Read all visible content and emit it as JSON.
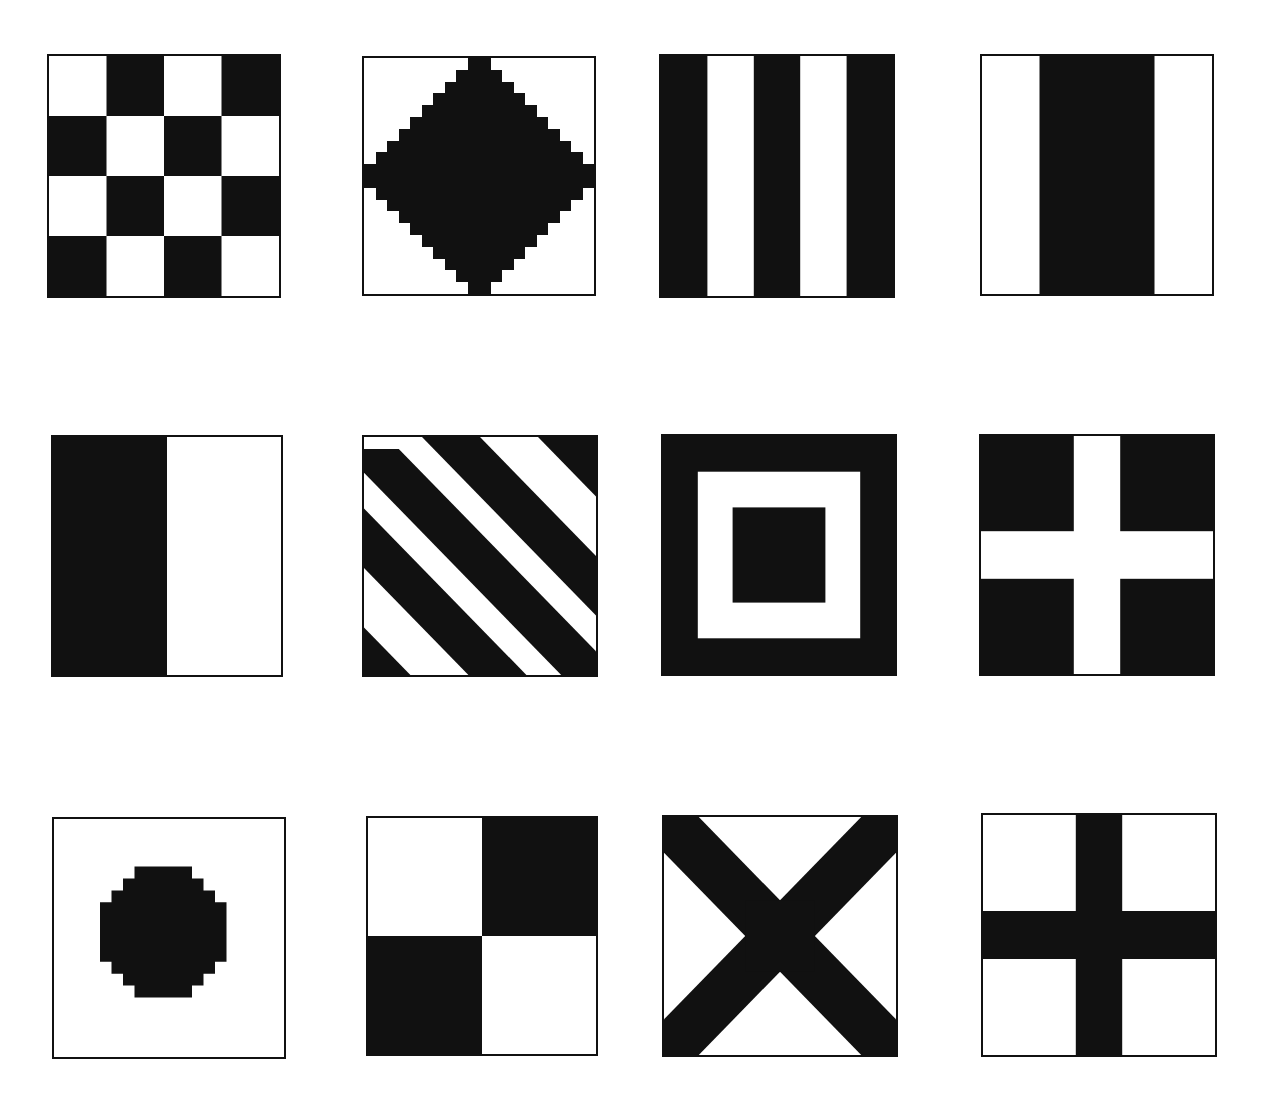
{
  "page": {
    "background": "#ffffff",
    "ink": "#111111"
  },
  "flags": [
    {
      "id": "checker",
      "label": "Checkerboard 4x4"
    },
    {
      "id": "diamond",
      "label": "Black diamond on white"
    },
    {
      "id": "vstripes",
      "label": "Vertical stripes black/white"
    },
    {
      "id": "center-band",
      "label": "White-black-white vertical bands"
    },
    {
      "id": "half-vertical",
      "label": "Black left half, white right half"
    },
    {
      "id": "diagonal-stripes",
      "label": "Diagonal stripes"
    },
    {
      "id": "square-in-square",
      "label": "Black square in white frame in black"
    },
    {
      "id": "white-cross",
      "label": "White cross on black"
    },
    {
      "id": "disc",
      "label": "Black disc on white"
    },
    {
      "id": "quartered",
      "label": "Quartered diagonally black/white"
    },
    {
      "id": "saltire",
      "label": "Black saltire on white"
    },
    {
      "id": "black-cross",
      "label": "Black cross on white"
    }
  ]
}
